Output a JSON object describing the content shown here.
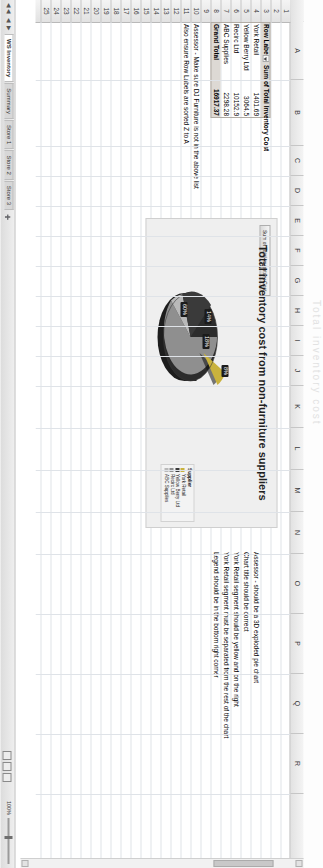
{
  "app": {
    "type": "spreadsheet",
    "ghost_text": "Total inventory cost"
  },
  "grid": {
    "column_headers": [
      "A",
      "B",
      "C",
      "D",
      "E",
      "F",
      "G",
      "H",
      "I",
      "J",
      "K",
      "L",
      "M",
      "N",
      "O",
      "P",
      "Q",
      "R"
    ],
    "row_headers": [
      "1",
      "2",
      "3",
      "4",
      "5",
      "6",
      "7",
      "8",
      "9",
      "10",
      "11",
      "12",
      "13",
      "14",
      "15",
      "16",
      "17",
      "18",
      "19",
      "20",
      "21",
      "22",
      "23",
      "24",
      "25"
    ]
  },
  "pivot_table": {
    "header_row_label": "Row Labels",
    "header_value_label": "Sum of Total Inventory Cost",
    "filter_icon": "filter-dropdown-icon",
    "rows": [
      {
        "label": "York Retail",
        "value": "1401.69"
      },
      {
        "label": "Yellow Berry Ltd",
        "value": "3064.5"
      },
      {
        "label": "Recirc Ltd",
        "value": "10152.9"
      },
      {
        "label": "ABC Supplies",
        "value": "2298.28"
      }
    ],
    "total": {
      "label": "Grand Total",
      "value": "16917.37"
    }
  },
  "notes_left": [
    "Assessor - Make sure DJ Furniture is not in the above list",
    "Also ensure Row Labels are sorted Z to A"
  ],
  "notes_right": [
    "Assessor - should be a 3D exploded pie chart",
    "Chart title should be correct",
    "York Retail segment should be yellow and on the right",
    "York Retail segment must be separated from the rest of the chart",
    "Legend should be in the bottom right corner"
  ],
  "chart": {
    "title": "Total inventory cost from non-furniture suppliers",
    "field_button": "Sum of Total Inventory Cost",
    "legend_title": "Supplier",
    "chart_data": {
      "type": "pie",
      "title": "Total inventory cost from non-furniture suppliers",
      "categories": [
        "York Retail",
        "Yellow Berry Ltd",
        "Recirc Ltd",
        "ABC Supplies"
      ],
      "values": [
        1401.69,
        3064.5,
        10152.9,
        2298.28
      ],
      "percent_labels": [
        "8%",
        "18%",
        "60%",
        "14%"
      ],
      "colors": [
        "#d9c34a",
        "#3a3a3a",
        "#8f8f8f",
        "#c3c3c3"
      ],
      "legend_position": "right",
      "exploded": true,
      "three_d": true,
      "xlabel": "",
      "ylabel": ""
    }
  },
  "sheet_tabs": {
    "nav_first": "◀◀",
    "nav_prev": "◀",
    "nav_next": "▶",
    "nav_last": "▶▶",
    "items": [
      {
        "label": "WS Inventory",
        "active": true
      },
      {
        "label": "Summary",
        "active": false
      },
      {
        "label": "Store 1",
        "active": false
      },
      {
        "label": "Store 2",
        "active": false
      },
      {
        "label": "Store 3",
        "active": false
      }
    ],
    "add_sheet_icon": "add-sheet-icon"
  },
  "status_bar": {
    "zoom_level": "100%",
    "view_normal_icon": "view-normal-icon",
    "view_layout_icon": "view-page-layout-icon",
    "view_break_icon": "view-page-break-icon"
  }
}
